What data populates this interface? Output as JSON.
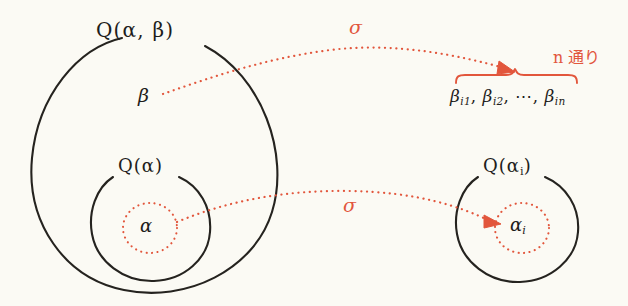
{
  "figure": {
    "kind": "hand-drawn-math-diagram",
    "topic": "field extension / conjugates under an embedding sigma",
    "background_color": "#fbfaf4",
    "ink_color": "#1e1d1b",
    "accent_color": "#e2563c"
  },
  "sets": {
    "outer_field": {
      "label": "Q(α, β)",
      "name": "outer-field-circle"
    },
    "inner_field": {
      "label": "Q(α)",
      "name": "inner-field-circle"
    },
    "image_field": {
      "label": "Q(αᵢ)",
      "label_base": "Q(α",
      "label_sub": "i",
      "label_close": ")",
      "name": "image-field-circle"
    }
  },
  "elements": {
    "beta": "β",
    "alpha": "α",
    "alpha_i_base": "α",
    "alpha_i_sub": "i"
  },
  "maps": {
    "sigma_top": "σ",
    "sigma_bottom": "σ"
  },
  "annotations": {
    "n_ways": "n 通り",
    "beta_list": {
      "items": [
        {
          "base": "β",
          "sub": "i1"
        },
        {
          "base": "β",
          "sub": "i2"
        },
        {
          "base": "β",
          "sub": "in"
        }
      ],
      "separator": ",",
      "ellipsis": "⋯",
      "plain": "βi1, βi2, ⋯, βin"
    }
  }
}
